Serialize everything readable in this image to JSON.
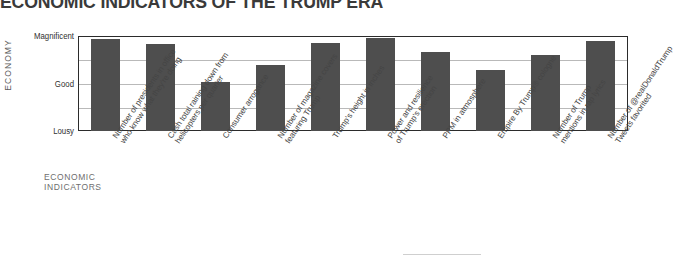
{
  "chart_data": {
    "type": "bar",
    "title": "ECONOMIC INDICATORS OF THE TRUMP ERA",
    "xlabel": "ECONOMIC INDICATORS",
    "ylabel": "ECONOMY",
    "ytick_labels": [
      "Magnificent",
      "Good",
      "Lousy"
    ],
    "ylim": [
      0,
      1
    ],
    "grid": true,
    "legend": "none",
    "categories": [
      "Number of presidents in office who know what they're doing",
      "Cash total raining down from helicopters per quarter",
      "Consumer arrogance",
      "Number of magazine covers featuring Trump",
      "Trump's height in inches",
      "Power and resilience of Trump's erection",
      "PPM in atmosphere",
      "Empire By Trump® cologne",
      "Number of Trump mentions in rap lyrics",
      "Tweets favorited",
      "Number of @realDonaldTrump Tweets favorited"
    ],
    "values": [
      0.97,
      0.92,
      0.52,
      0.7,
      0.93,
      0.98,
      0.83,
      0.64,
      0.95,
      0.0,
      0.0
    ],
    "bar_color": "#4e4e4e",
    "frame_color": "#2b2b2b",
    "grid_color": "#b9b9b9"
  },
  "axes": {
    "y_title": "ECONOMY",
    "y_ticks": [
      {
        "label": "Magnificent",
        "value": 1.0
      },
      {
        "label": "Good",
        "value": 0.5
      },
      {
        "label": "Lousy",
        "value": 0.0
      }
    ],
    "x_title_line1": "ECONOMIC",
    "x_title_line2": "INDICATORS"
  },
  "bars": [
    {
      "label_line1": "Number of presidents in office",
      "label_line2": "who know what they're doing",
      "value": 0.97
    },
    {
      "label_line1": "Cash total raining down from",
      "label_line2": "helicopters per quarter",
      "value": 0.92
    },
    {
      "label_line1": "Consumer arrogance",
      "label_line2": "",
      "value": 0.52
    },
    {
      "label_line1": "Number of magazine covers",
      "label_line2": "featuring Trump",
      "value": 0.7
    },
    {
      "label_line1": "Trump's height in inches",
      "label_line2": "",
      "value": 0.93
    },
    {
      "label_line1": "Power and resilience",
      "label_line2": "of Trump's erection",
      "value": 0.98
    },
    {
      "label_line1": "PPM in atmosphere",
      "label_line2": "",
      "value": 0.83
    },
    {
      "label_line1": "Empire By Trump® cologne",
      "label_line2": "",
      "value": 0.64
    },
    {
      "label_line1": "Number of Trump",
      "label_line2": "mentions in rap lyrics",
      "value": 0.8
    },
    {
      "label_line1": "Number of @realDonaldTrump",
      "label_line2": "Tweets favorited",
      "value": 0.95
    }
  ]
}
